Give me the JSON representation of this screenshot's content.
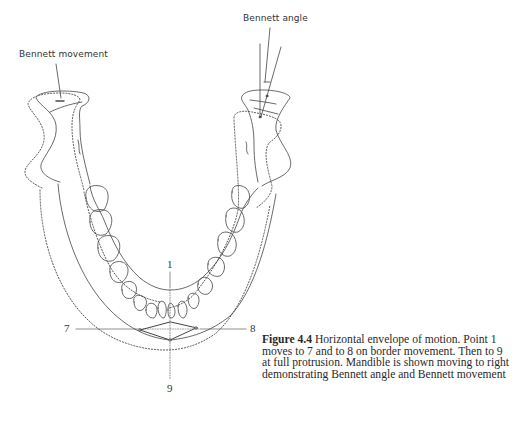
{
  "labels": {
    "bennett_movement": "Bennett movement",
    "bennett_angle": "Bennett angle",
    "point_1": "1",
    "point_7": "7",
    "point_8": "8",
    "point_9": "9"
  },
  "caption": {
    "figure_number": "Figure 4.4",
    "text": " Horizontal envelope of motion. Point 1 moves to 7 and to 8 on border movement. Then to 9 at full protrusion. Mandible is shown moving to right demonstrating Bennett angle and Bennett movement"
  },
  "colors": {
    "ink": "#333333",
    "background": "#ffffff"
  }
}
